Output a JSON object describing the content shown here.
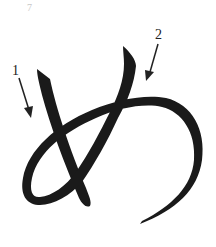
{
  "diagram": {
    "character": "め",
    "page_mark": "7",
    "strokes": [
      {
        "number": "1",
        "label": "1"
      },
      {
        "number": "2",
        "label": "2"
      }
    ],
    "colors": {
      "stroke": "#1a1a1a",
      "arrow": "#222222",
      "background": "#ffffff",
      "page_mark": "#c8c8c8"
    }
  }
}
